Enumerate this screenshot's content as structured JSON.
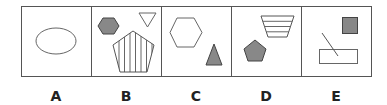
{
  "figure": {
    "type": "odd-one-out puzzle",
    "stroke_color": "#555555",
    "fill_color": "#888888",
    "panels": [
      {
        "label": "A",
        "shapes": [
          "white ellipse"
        ]
      },
      {
        "label": "B",
        "shapes": [
          "gray hexagon",
          "white inverted triangle",
          "vertically striped pentagon"
        ]
      },
      {
        "label": "C",
        "shapes": [
          "white hexagon",
          "gray triangle"
        ]
      },
      {
        "label": "D",
        "shapes": [
          "horizontally striped trapezoid",
          "gray pentagon"
        ]
      },
      {
        "label": "E",
        "shapes": [
          "gray square",
          "diagonal line",
          "white rectangle"
        ]
      }
    ]
  }
}
